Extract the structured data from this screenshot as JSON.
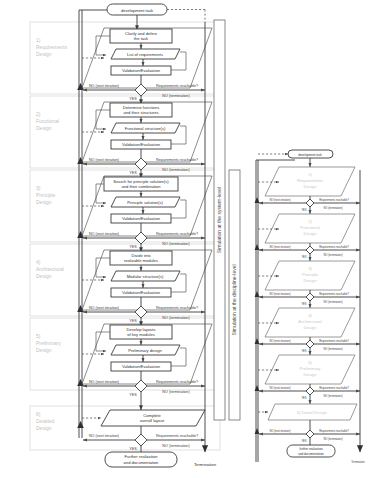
{
  "diagram": {
    "start_node": "development task",
    "end_node": "Termination",
    "final_node": "Further realization\nand documentation",
    "colors": {
      "stroke": "#3a3a3a",
      "section_label": "#c2c2c2",
      "background": "#ffffff",
      "faint_stroke": "#808080"
    },
    "swimlane_labels": [
      {
        "id": "system-level",
        "text": "Simulation at the system-level"
      },
      {
        "id": "discipline-level",
        "text": "Simulation at the discipline-level"
      }
    ],
    "edge_labels": {
      "no_iteration": "NO (next iteration)",
      "yes": "YES",
      "no_termination": "NO (termination)",
      "decision": "Requirements reachable?"
    },
    "left_column": {
      "start": "development task",
      "termination": "Termination",
      "final": {
        "line1": "Further realization",
        "line2": "and documentation"
      },
      "stages": [
        {
          "id": "requirements-design",
          "section": {
            "line1": "1)",
            "line2": "Requirements",
            "line3": "Design"
          },
          "activity": {
            "line1": "Clarify and define",
            "line2": "the task"
          },
          "artifact": "List of requirements",
          "validation": "Validation/Evaluation",
          "decision": "Requirements reachable?",
          "yes": "YES",
          "no_iteration": "NO (next iteration)",
          "no_termination": "NO (termination)"
        },
        {
          "id": "functional-design",
          "section": {
            "line1": "2)",
            "line2": "Functional",
            "line3": "Design"
          },
          "activity": {
            "line1": "Determine functions",
            "line2": "and their structures"
          },
          "artifact": "Functional structure(s)",
          "validation": "Validation/Evaluation",
          "decision": "Requirements reachable?",
          "yes": "YES",
          "no_iteration": "NO (next iteration)",
          "no_termination": "NO (termination)"
        },
        {
          "id": "principle-design",
          "section": {
            "line1": "3)",
            "line2": "Principle",
            "line3": "Design"
          },
          "activity": {
            "line1": "Search for principle solution(s)",
            "line2": "and their combination"
          },
          "artifact": "Principle solution(s)",
          "validation": "Validation/Evaluation",
          "decision": "Requirements reachable?",
          "yes": "YES",
          "no_iteration": "NO (next iteration)",
          "no_termination": "NO (termination)"
        },
        {
          "id": "architectural-design",
          "section": {
            "line1": "4)",
            "line2": "Architectural",
            "line3": "Design"
          },
          "activity": {
            "line1": "Divide into",
            "line2": "realizable modules"
          },
          "artifact": "Modular structure(s)",
          "validation": "Validation/Evaluation",
          "decision": "Requirements reachable?",
          "yes": "YES",
          "no_iteration": "NO (next iteration)",
          "no_termination": "NO (termination)"
        },
        {
          "id": "preliminary-design",
          "section": {
            "line1": "5)",
            "line2": "Preliminary",
            "line3": "Design"
          },
          "activity": {
            "line1": "Develop layouts",
            "line2": "of key modules"
          },
          "artifact": "Preliminary design",
          "validation": "Validation/Evaluation",
          "decision": "Requirements reachable?",
          "yes": "YES",
          "no_iteration": "NO (next iteration)",
          "no_termination": "NO (termination)"
        },
        {
          "id": "detailed-design",
          "section": {
            "line1": "6)",
            "line2": "Detailed",
            "line3": "Design"
          },
          "activity": {
            "line1": "Complete",
            "line2": "overall layout"
          },
          "artifact": "",
          "validation": "",
          "decision": "Requirements reachable?",
          "yes": "YES",
          "no_iteration": "NO (next iteration)",
          "no_termination": "NO (termination)"
        }
      ]
    },
    "right_column": {
      "start": "development task",
      "termination": "Termination",
      "final": {
        "line1": "further realization",
        "line2": "and documentation"
      },
      "stages": [
        {
          "id": "r-requirements-design",
          "line1": "1)",
          "line2": "Requirements",
          "line3": "Design",
          "decision": "Requirements reachable?",
          "yes": "YES",
          "no_iteration": "NO (next iteration)",
          "no_termination": "NO (termination)"
        },
        {
          "id": "r-functional-design",
          "line1": "2)",
          "line2": "Functional",
          "line3": "Design",
          "decision": "Requirements reachable?",
          "yes": "YES",
          "no_iteration": "NO (next iteration)",
          "no_termination": "NO (termination)"
        },
        {
          "id": "r-principle-design",
          "line1": "3)",
          "line2": "Principle",
          "line3": "Design",
          "decision": "Requirements reachable?",
          "yes": "YES",
          "no_iteration": "NO (next iteration)",
          "no_termination": "NO (termination)"
        },
        {
          "id": "r-architectural-design",
          "line1": "4)",
          "line2": "Architectural",
          "line3": "Design",
          "decision": "Requirements reachable?",
          "yes": "YES",
          "no_iteration": "NO (next iteration)",
          "no_termination": "NO (termination)"
        },
        {
          "id": "r-preliminary-design",
          "line1": "5)",
          "line2": "Preliminary",
          "line3": "Design",
          "decision": "Requirements reachable?",
          "yes": "YES",
          "no_iteration": "NO (next iteration)",
          "no_termination": "NO (termination)"
        },
        {
          "id": "r-detail-design",
          "line1": "",
          "line2": "6) Detail Design",
          "line3": "",
          "decision": "Requirements reachable?",
          "yes": "YES",
          "no_iteration": "NO (next iteration)",
          "no_termination": "NO (termination)"
        }
      ]
    }
  }
}
